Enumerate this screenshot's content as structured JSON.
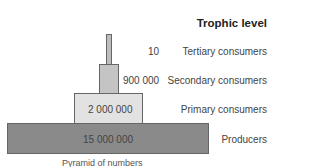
{
  "title": "Trophic level",
  "levels": [
    {
      "name": "Tertiary consumers",
      "count": "10"
    },
    {
      "name": "Secondary consumers",
      "count": "900 000"
    },
    {
      "name": "Primary consumers",
      "count": "2 000 000"
    },
    {
      "name": "Producers",
      "count": "15 000 000"
    }
  ],
  "caption": "Pyramid of numbers",
  "colors": {
    "tertiary": "#bdbdbd",
    "secondary": "#c4c4c4",
    "primary": "#e2e2e2",
    "producers": "#8a8a8a"
  }
}
